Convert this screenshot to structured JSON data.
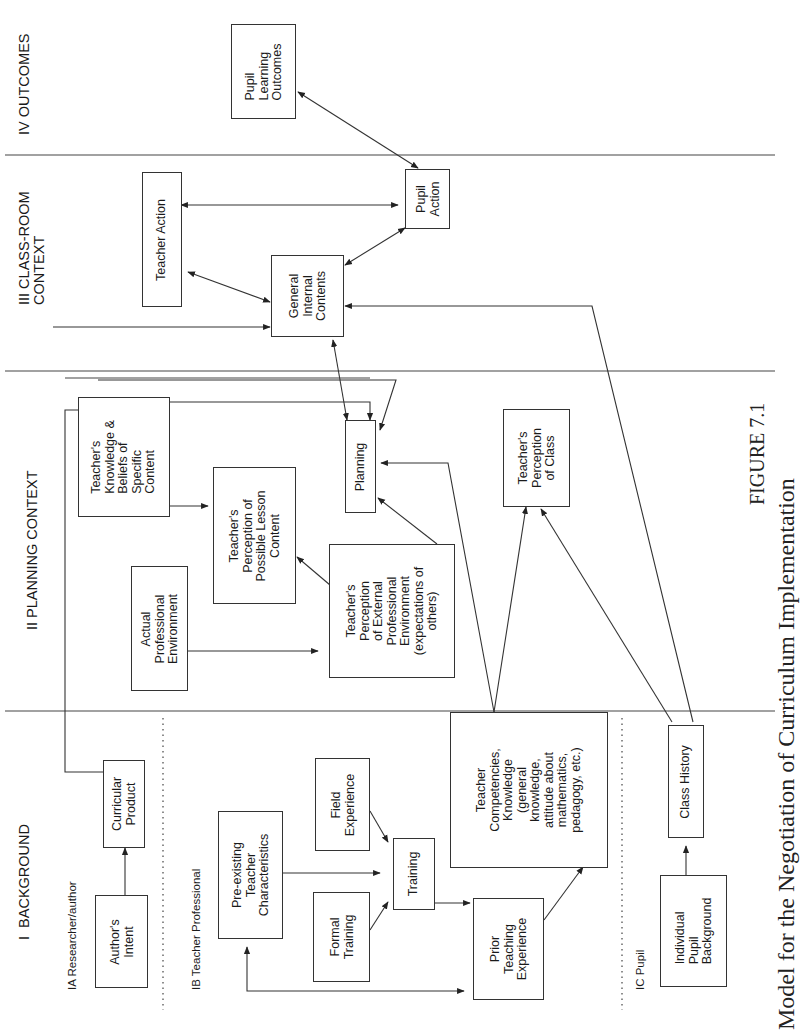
{
  "sections": {
    "background": "I  BACKGROUND",
    "planning": "II PLANNING CONTEXT",
    "classroom": "III CLASS-ROOM\nCONTEXT",
    "outcomes": "IV OUTCOMES"
  },
  "subsections": {
    "researcher": "IA Researcher/author",
    "teacher_professional": "IB Teacher Professional",
    "pupil": "IC Pupil"
  },
  "nodes": {
    "authors_intent": "Author's\nIntent",
    "curricular_product": "Curricular\nProduct",
    "pre_existing": "Pre-existing\nTeacher\nCharacteristics",
    "field_experience": "Field\nExperience",
    "formal_training": "Formal\nTraining",
    "training": "Training",
    "prior_teaching": "Prior\nTeaching\nExperience",
    "teacher_competencies": "Teacher\nCompetencies,\nKnowledge\n(general\nknowledge,\nattitude about\nmathematics,\npedagogy, etc.)",
    "individual_pupil": "Individual\nPupil\nBackground",
    "class_history": "Class History",
    "knowledge_beliefs": "Teacher's\nKnowledge &\nBeliefs of\nSpecific\nContent",
    "perception_lesson": "Teacher's\nPerception of\nPossible Lesson\nContent",
    "actual_environment": "Actual\nProfessional\nEnvironment",
    "perception_external": "Teacher's\nPerception\nof External\nProfessional\nEnvironment\n(expectations of\nothers)",
    "planning": "Planning",
    "perception_class": "Teacher's\nPerception\nof Class",
    "general_internal": "General\nInternal\nContents",
    "teacher_action": "Teacher Action",
    "pupil_action": "Pupil\nAction",
    "pupil_learning": "Pupil\nLearning\nOutcomes"
  },
  "caption": {
    "figure": "FIGURE 7.1",
    "title": "Model for the Negotiation of Curriculum Implementation"
  }
}
